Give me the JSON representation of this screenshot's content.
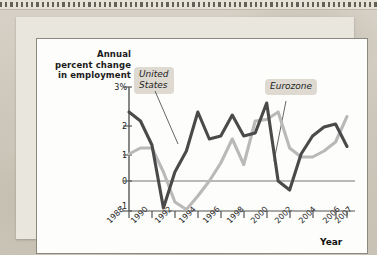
{
  "figure": {
    "y_axis_title": "Annual percent change in employment",
    "x_axis_title": "Year"
  },
  "labels": {
    "us": "United\nStates",
    "us_line1": "United",
    "us_line2": "States",
    "eurozone": "Eurozone"
  },
  "colors": {
    "us_line": "#4a4a4a",
    "eurozone_line": "#b9b9b9",
    "axis": "#555555",
    "panel_background": "#fdfdfb",
    "label_badge": "#dedad2",
    "page_background": "#cfcabf"
  },
  "chart_data": {
    "type": "line",
    "title": "",
    "xlabel": "Year",
    "ylabel": "Annual percent change in employment",
    "ylim": [
      -1,
      3
    ],
    "xlim": [
      1988,
      2007
    ],
    "grid": false,
    "legend_position": "inline-annotations",
    "ytick_labels": [
      "3%",
      "2",
      "1",
      "0",
      "-1"
    ],
    "ytick_values": [
      3,
      2,
      1,
      0,
      -1
    ],
    "xtick_labels": [
      "1988",
      "1990",
      "1992",
      "1994",
      "1996",
      "1998",
      "2000",
      "2002",
      "2004",
      "2006",
      "2007"
    ],
    "xtick_values": [
      1988,
      1990,
      1992,
      1994,
      1996,
      1998,
      2000,
      2002,
      2004,
      2006,
      2007
    ],
    "x": [
      1988,
      1989,
      1990,
      1991,
      1992,
      1993,
      1994,
      1995,
      1996,
      1997,
      1998,
      1999,
      2000,
      2001,
      2002,
      2003,
      2004,
      2005,
      2006,
      2007
    ],
    "series": [
      {
        "name": "United States",
        "color": "#4a4a4a",
        "values": [
          2.3,
          2.0,
          1.2,
          -0.9,
          0.3,
          1.0,
          2.3,
          1.4,
          1.5,
          2.2,
          1.5,
          1.6,
          2.6,
          0.0,
          -0.3,
          0.9,
          1.5,
          1.8,
          1.9,
          1.15
        ]
      },
      {
        "name": "Eurozone",
        "color": "#b9b9b9",
        "values": [
          0.9,
          1.1,
          1.1,
          0.3,
          -0.7,
          -0.95,
          -0.5,
          0.0,
          0.6,
          1.4,
          0.55,
          2.0,
          2.05,
          2.3,
          1.1,
          0.8,
          0.8,
          1.0,
          1.3,
          2.15
        ]
      }
    ],
    "annotations": [
      {
        "text": "United States",
        "points_to_year": 1993
      },
      {
        "text": "Eurozone",
        "points_to_year": 2002
      }
    ]
  }
}
